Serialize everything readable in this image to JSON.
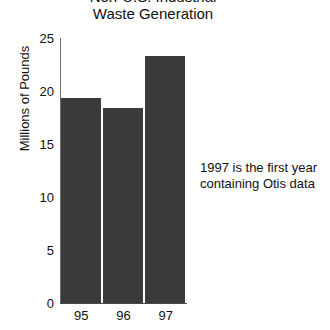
{
  "chart_data": {
    "type": "bar",
    "title": "Non-U.S. Industrial\nWaste Generation",
    "title_line1": "Non-U.S. Industrial",
    "title_line2": "Waste Generation",
    "xlabel": "",
    "ylabel": "Millions of Pounds",
    "categories": [
      "95",
      "96",
      "97"
    ],
    "values": [
      19.3,
      18.4,
      23.3
    ],
    "ylim": [
      0,
      25
    ],
    "yticks": [
      0,
      5,
      10,
      15,
      20,
      25
    ],
    "ytick_labels": [
      "0",
      "5",
      "10",
      "15",
      "20",
      "25"
    ],
    "grid": false,
    "legend": null,
    "bar_color": "#3a3a3a",
    "axis_color": "#4a4a4a",
    "background": "#ffffff",
    "annotations": [
      {
        "text": "1997 is the first year\ncontaining Otis data",
        "line1": "1997 is the first year",
        "line2": "containing Otis data",
        "position": "right-of-plot"
      }
    ]
  }
}
